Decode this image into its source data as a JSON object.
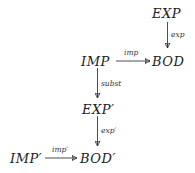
{
  "diagram": {
    "nodes": {
      "exp": "EXP",
      "imp": "IMP",
      "bod": "BOD",
      "exp_prime": "EXP′",
      "imp_prime": "IMP′",
      "bod_prime": "BOD′"
    },
    "edges": {
      "exp_to_bod": "exp",
      "imp_to_bod": "imp",
      "imp_to_exp_prime": "subst",
      "exp_prime_to_bod_prime": "exp′",
      "imp_prime_to_bod_prime": "imp′"
    },
    "colors": {
      "ink": "#222222",
      "background": "#ffffff"
    }
  }
}
